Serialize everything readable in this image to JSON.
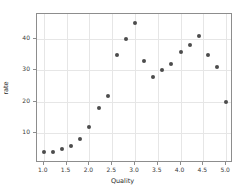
{
  "chart_data": {
    "type": "scatter",
    "title": "",
    "xlabel": "Quality",
    "ylabel": "rate",
    "xlim": [
      0.85,
      5.15
    ],
    "ylim": [
      0.5,
      48.0
    ],
    "grid": true,
    "legend": null,
    "marker_color": "#4c4c4c",
    "xticks": [
      "1.0",
      "1.5",
      "2.0",
      "2.5",
      "3.0",
      "3.5",
      "4.0",
      "4.5",
      "5.0"
    ],
    "xtick_values": [
      1.0,
      1.5,
      2.0,
      2.5,
      3.0,
      3.5,
      4.0,
      4.5,
      5.0
    ],
    "yticks": [
      "10",
      "20",
      "30",
      "40"
    ],
    "ytick_values": [
      10,
      20,
      30,
      40
    ],
    "x": [
      1.0,
      1.2,
      1.4,
      1.6,
      1.8,
      2.0,
      2.2,
      2.4,
      2.6,
      2.8,
      3.0,
      3.2,
      3.4,
      3.6,
      3.8,
      4.0,
      4.2,
      4.4,
      4.6,
      4.8,
      5.0
    ],
    "y": [
      4,
      4,
      5,
      6,
      8,
      12,
      18,
      22,
      35,
      40,
      45,
      33,
      28,
      30,
      32,
      36,
      38,
      41,
      35,
      31,
      20
    ],
    "points": [
      {
        "x": 1.0,
        "y": 4
      },
      {
        "x": 1.2,
        "y": 4
      },
      {
        "x": 1.4,
        "y": 5
      },
      {
        "x": 1.6,
        "y": 6
      },
      {
        "x": 1.8,
        "y": 8
      },
      {
        "x": 2.0,
        "y": 12
      },
      {
        "x": 2.2,
        "y": 18
      },
      {
        "x": 2.4,
        "y": 22
      },
      {
        "x": 2.6,
        "y": 35
      },
      {
        "x": 2.8,
        "y": 40
      },
      {
        "x": 3.0,
        "y": 45
      },
      {
        "x": 3.2,
        "y": 33
      },
      {
        "x": 3.4,
        "y": 28
      },
      {
        "x": 3.6,
        "y": 30
      },
      {
        "x": 3.8,
        "y": 32
      },
      {
        "x": 4.0,
        "y": 36
      },
      {
        "x": 4.2,
        "y": 38
      },
      {
        "x": 4.4,
        "y": 41
      },
      {
        "x": 4.6,
        "y": 35
      },
      {
        "x": 4.8,
        "y": 31
      },
      {
        "x": 5.0,
        "y": 20
      }
    ]
  }
}
